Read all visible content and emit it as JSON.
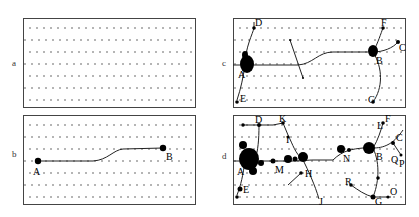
{
  "panels": [
    {
      "id": "a",
      "label": "a"
    },
    {
      "id": "b",
      "label": "b",
      "nodes": [
        "A",
        "B"
      ]
    },
    {
      "id": "c",
      "label": "c",
      "nodes": [
        "A",
        "B",
        "C",
        "D",
        "E",
        "F",
        "G"
      ]
    },
    {
      "id": "d",
      "label": "d",
      "nodes": [
        "A",
        "B",
        "C",
        "D",
        "E",
        "F",
        "G",
        "H",
        "I",
        "J",
        "K",
        "L",
        "M",
        "N",
        "O",
        "P",
        "Q",
        "R"
      ]
    }
  ],
  "colors": {
    "border": "#444444",
    "dots": "#333333",
    "path": "#222222",
    "node": "#000000"
  }
}
